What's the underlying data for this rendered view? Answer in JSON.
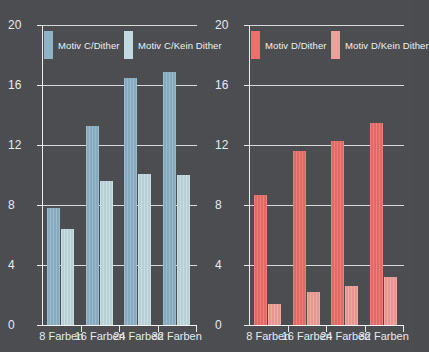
{
  "background_color": "#4a4c50",
  "charts": [
    {
      "id": "chart-motiv-c",
      "chart_data": {
        "type": "bar",
        "title": "",
        "subtitle": "",
        "xlabel": "",
        "ylabel": "",
        "categories": [
          "8 Farben",
          "16 Farben",
          "24 Farben",
          "32 Farben"
        ],
        "yticks": [
          "0",
          "4",
          "8",
          "12",
          "16",
          "20"
        ],
        "ytick_values": [
          0,
          4,
          8,
          12,
          16,
          20
        ],
        "ylim": [
          0,
          20
        ],
        "grid": true,
        "legend_position": "top-inside",
        "series": [
          {
            "name": "Motiv C/Dither",
            "color": "#8fb4c9",
            "values": [
              7.8,
              13.3,
              16.5,
              16.9
            ]
          },
          {
            "name": "Motiv C/Kein Dither",
            "color": "#c3dde2",
            "values": [
              6.4,
              9.6,
              10.1,
              10.0
            ]
          }
        ]
      }
    },
    {
      "id": "chart-motiv-d",
      "chart_data": {
        "type": "bar",
        "title": "",
        "subtitle": "",
        "xlabel": "",
        "ylabel": "",
        "categories": [
          "8 Farben",
          "16 Farben",
          "24 Farben",
          "32 Farben"
        ],
        "yticks": [
          "0",
          "4",
          "8",
          "12",
          "16",
          "20"
        ],
        "ytick_values": [
          0,
          4,
          8,
          12,
          16,
          20
        ],
        "ylim": [
          0,
          20
        ],
        "grid": true,
        "legend_position": "top-inside",
        "series": [
          {
            "name": "Motiv D/Dither",
            "color": "#ef6f6a",
            "values": [
              8.7,
              11.6,
              12.3,
              13.5
            ]
          },
          {
            "name": "Motiv D/Kein Dither",
            "color": "#f2a09a",
            "values": [
              1.4,
              2.2,
              2.6,
              3.2
            ]
          }
        ]
      }
    }
  ]
}
